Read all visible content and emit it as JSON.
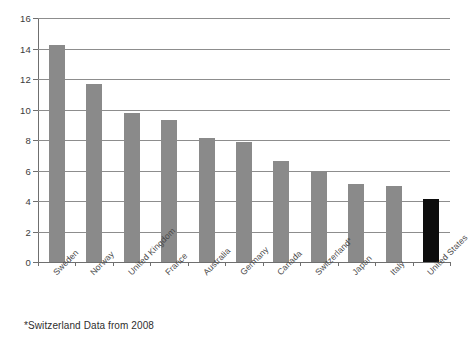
{
  "chart_data": {
    "type": "bar",
    "title": "",
    "subtitle": "",
    "xlabel": "",
    "ylabel": "",
    "ylim": [
      0,
      16
    ],
    "ytick_step": 2,
    "yticks": [
      "0",
      "2",
      "4",
      "6",
      "8",
      "10",
      "12",
      "14",
      "16"
    ],
    "grid": true,
    "legend": null,
    "categories": [
      "Sweden",
      "Norway",
      "United Kingdom",
      "France",
      "Australia",
      "Germany",
      "Canada",
      "Switzerland*",
      "Japan",
      "Italy",
      "United States"
    ],
    "values": [
      14.2,
      11.7,
      9.8,
      9.3,
      8.1,
      7.9,
      6.6,
      6.0,
      5.1,
      5.0,
      4.1
    ],
    "bar_colors": [
      "#8a8a8a",
      "#8a8a8a",
      "#8a8a8a",
      "#8a8a8a",
      "#8a8a8a",
      "#8a8a8a",
      "#8a8a8a",
      "#8a8a8a",
      "#8a8a8a",
      "#8a8a8a",
      "#0d0d0d"
    ],
    "highlight_index": 10,
    "annotations": [
      "*Switzerland Data from 2008"
    ]
  },
  "footnote": {
    "text": "*Switzerland Data from 2008"
  },
  "colors": {
    "bar_default": "#8a8a8a",
    "bar_highlight": "#0d0d0d",
    "gridline": "#8d8d8d",
    "axis": "#6f6f6f",
    "tick_text": "#3b3b3b",
    "label_text": "#4a4a4a",
    "background": "#ffffff"
  }
}
